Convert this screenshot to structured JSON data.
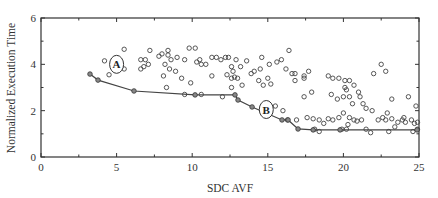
{
  "chart_data": {
    "type": "scatter",
    "title": "",
    "xlabel": "SDC AVF",
    "ylabel": "Normalized Execution Time",
    "xlim": [
      0,
      25
    ],
    "ylim": [
      0,
      6
    ],
    "x_ticks": [
      0,
      5,
      10,
      15,
      20,
      25
    ],
    "y_ticks": [
      0,
      2,
      4,
      6
    ],
    "x_minor_ticks": [
      2.5,
      7.5,
      12.5,
      17.5,
      22.5
    ],
    "y_minor_ticks": [
      1,
      3,
      5
    ],
    "grid": false,
    "legend": null,
    "series": [
      {
        "name": "design points",
        "style": "open-circle",
        "points": [
          [
            4.2,
            4.15
          ],
          [
            4.5,
            3.55
          ],
          [
            5.5,
            4.65
          ],
          [
            5.5,
            3.8
          ],
          [
            6.6,
            4.2
          ],
          [
            6.9,
            4.2
          ],
          [
            6.8,
            3.9
          ],
          [
            7.1,
            4.0
          ],
          [
            6.6,
            3.8
          ],
          [
            7.8,
            4.35
          ],
          [
            8.2,
            4.0
          ],
          [
            7.2,
            4.6
          ],
          [
            8.0,
            4.45
          ],
          [
            8.4,
            4.6
          ],
          [
            8.1,
            3.5
          ],
          [
            8.5,
            3.8
          ],
          [
            8.9,
            3.7
          ],
          [
            8.4,
            4.4
          ],
          [
            8.6,
            4.2
          ],
          [
            9.0,
            4.3
          ],
          [
            8.3,
            3.0
          ],
          [
            9.8,
            4.7
          ],
          [
            10.2,
            4.7
          ],
          [
            9.5,
            4.2
          ],
          [
            9.3,
            3.4
          ],
          [
            9.9,
            3.2
          ],
          [
            10.3,
            4.1
          ],
          [
            10.5,
            4.2
          ],
          [
            10.6,
            4.0
          ],
          [
            10.9,
            4.0
          ],
          [
            11.3,
            3.5
          ],
          [
            9.5,
            2.7
          ],
          [
            11.3,
            4.3
          ],
          [
            11.6,
            4.3
          ],
          [
            11.9,
            4.2
          ],
          [
            12.2,
            4.3
          ],
          [
            12.4,
            4.3
          ],
          [
            12.3,
            3.55
          ],
          [
            12.6,
            3.4
          ],
          [
            12.8,
            3.45
          ],
          [
            12.7,
            3.7
          ],
          [
            12.6,
            3.9
          ],
          [
            12.9,
            4.2
          ],
          [
            12.6,
            3.0
          ],
          [
            10.6,
            2.7
          ],
          [
            12.0,
            2.6
          ],
          [
            13.2,
            3.9
          ],
          [
            13.0,
            3.4
          ],
          [
            13.6,
            4.15
          ],
          [
            13.3,
            3.1
          ],
          [
            14.1,
            3.7
          ],
          [
            14.5,
            3.8
          ],
          [
            13.9,
            3.6
          ],
          [
            14.6,
            4.3
          ],
          [
            15.1,
            4.0
          ],
          [
            14.4,
            3.3
          ],
          [
            14.7,
            3.1
          ],
          [
            15.0,
            3.4
          ],
          [
            15.2,
            3.15
          ],
          [
            15.9,
            4.2
          ],
          [
            15.6,
            4.1
          ],
          [
            16.4,
            4.6
          ],
          [
            16.2,
            3.8
          ],
          [
            16.6,
            3.6
          ],
          [
            16.8,
            3.6
          ],
          [
            17.4,
            3.5
          ],
          [
            17.7,
            3.7
          ],
          [
            17.4,
            3.4
          ],
          [
            16.8,
            3.3
          ],
          [
            17.4,
            2.6
          ],
          [
            17.9,
            2.8
          ],
          [
            16.0,
            2.0
          ],
          [
            15.5,
            2.2
          ],
          [
            16.3,
            1.6
          ],
          [
            16.9,
            1.6
          ],
          [
            19.0,
            3.5
          ],
          [
            19.3,
            3.4
          ],
          [
            19.7,
            3.4
          ],
          [
            20.1,
            3.3
          ],
          [
            19.2,
            2.7
          ],
          [
            19.6,
            2.5
          ],
          [
            20.1,
            3.0
          ],
          [
            20.4,
            3.3
          ],
          [
            20.7,
            3.1
          ],
          [
            20.2,
            2.9
          ],
          [
            20.0,
            2.6
          ],
          [
            20.4,
            2.6
          ],
          [
            20.6,
            2.3
          ],
          [
            21.0,
            2.8
          ],
          [
            21.1,
            2.6
          ],
          [
            21.3,
            2.3
          ],
          [
            22.0,
            3.6
          ],
          [
            22.5,
            4.0
          ],
          [
            22.8,
            3.7
          ],
          [
            21.5,
            2.1
          ],
          [
            21.9,
            2.0
          ],
          [
            20.4,
            1.7
          ],
          [
            20.7,
            1.6
          ],
          [
            20.9,
            1.55
          ],
          [
            21.2,
            1.6
          ],
          [
            20.0,
            1.9
          ],
          [
            19.7,
            1.7
          ],
          [
            20.3,
            1.4
          ],
          [
            21.5,
            1.2
          ],
          [
            21.8,
            1.05
          ],
          [
            22.3,
            1.6
          ],
          [
            22.6,
            1.7
          ],
          [
            22.8,
            1.6
          ],
          [
            23.2,
            1.65
          ],
          [
            23.6,
            1.5
          ],
          [
            23.9,
            1.6
          ],
          [
            24.1,
            1.5
          ],
          [
            23.4,
            1.3
          ],
          [
            23.0,
            1.1
          ],
          [
            24.5,
            1.6
          ],
          [
            24.7,
            1.45
          ],
          [
            24.9,
            1.5
          ],
          [
            24.6,
            1.1
          ],
          [
            24.9,
            1.2
          ],
          [
            23.2,
            2.5
          ],
          [
            24.3,
            2.6
          ],
          [
            24.8,
            2.2
          ],
          [
            22.9,
            1.9
          ],
          [
            24.0,
            1.7
          ],
          [
            17.6,
            1.7
          ],
          [
            18.0,
            1.65
          ],
          [
            18.4,
            1.6
          ],
          [
            18.7,
            1.45
          ],
          [
            19.0,
            1.65
          ],
          [
            19.3,
            1.6
          ],
          [
            18.1,
            1.2
          ],
          [
            18.4,
            1.1
          ],
          [
            19.9,
            1.2
          ],
          [
            20.2,
            1.2
          ]
        ]
      },
      {
        "name": "pareto front",
        "style": "line-with-filled-circles",
        "points": [
          [
            3.24,
            3.58
          ],
          [
            3.77,
            3.32
          ],
          [
            6.15,
            2.85
          ],
          [
            10.19,
            2.68
          ],
          [
            12.83,
            2.68
          ],
          [
            13.03,
            2.46
          ],
          [
            13.96,
            2.16
          ],
          [
            15.94,
            1.6
          ],
          [
            16.34,
            1.6
          ],
          [
            17.0,
            1.21
          ],
          [
            18.0,
            1.17
          ],
          [
            19.78,
            1.17
          ],
          [
            24.87,
            1.17
          ]
        ]
      }
    ],
    "annotations": [
      {
        "label": "A",
        "x": 5.0,
        "y": 4.0,
        "shape": "ellipse"
      },
      {
        "label": "B",
        "x": 14.9,
        "y": 2.05,
        "shape": "ellipse"
      }
    ]
  }
}
